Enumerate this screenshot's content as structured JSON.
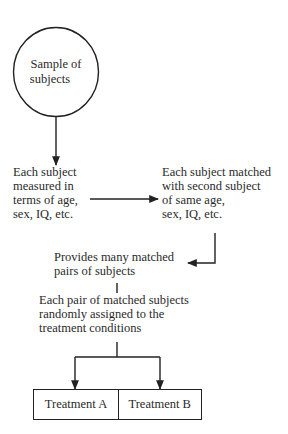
{
  "diagram": {
    "type": "flowchart",
    "start": {
      "shape": "circle",
      "lines": [
        "Sample of",
        "subjects"
      ]
    },
    "step1": {
      "lines": [
        "Each subject",
        "measured in",
        "terms of age,",
        "sex, IQ, etc."
      ]
    },
    "step2": {
      "lines": [
        "Each subject matched",
        "with second subject",
        "of same age,",
        "sex, IQ, etc."
      ]
    },
    "step3": {
      "lines": [
        "Provides many matched",
        "pairs of subjects"
      ]
    },
    "step4": {
      "lines": [
        "Each pair of matched subjects",
        "randomly assigned to the",
        "treatment conditions"
      ]
    },
    "outcomes": [
      {
        "label": "Treatment A"
      },
      {
        "label": "Treatment B"
      }
    ],
    "edges": [
      {
        "from": "start",
        "to": "step1",
        "style": "arrow-down"
      },
      {
        "from": "step1",
        "to": "step2",
        "style": "arrow-right"
      },
      {
        "from": "step2",
        "to": "step3",
        "style": "elbow-arrow-left"
      },
      {
        "from": "step3",
        "to": "step4",
        "style": "line"
      },
      {
        "from": "step4",
        "to": "Treatment A",
        "style": "branch-arrow"
      },
      {
        "from": "step4",
        "to": "Treatment B",
        "style": "branch-arrow"
      }
    ],
    "colors": {
      "stroke": "#222222",
      "text": "#2a2a2a",
      "background": "#ffffff"
    }
  }
}
